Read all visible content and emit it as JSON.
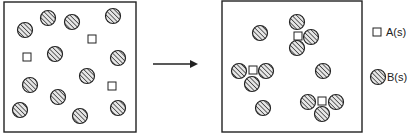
{
  "diagram": {
    "type": "particle-reaction",
    "colors": {
      "stroke": "#222222",
      "hatch": "#333333",
      "fill_bg": "#e8e8e8",
      "square_fill": "#ffffff",
      "background": "#ffffff"
    },
    "particle_radius": 7.5,
    "square_size": 8,
    "before_box": {
      "x": 4,
      "y": 2,
      "width": 132,
      "height": 130,
      "circles": [
        [
          25,
          30
        ],
        [
          48,
          18
        ],
        [
          72,
          22
        ],
        [
          113,
          16
        ],
        [
          55,
          54
        ],
        [
          118,
          58
        ],
        [
          87,
          76
        ],
        [
          30,
          85
        ],
        [
          58,
          97
        ],
        [
          20,
          110
        ],
        [
          80,
          116
        ],
        [
          118,
          108
        ]
      ],
      "squares": [
        [
          27,
          57
        ],
        [
          92,
          39
        ],
        [
          112,
          86
        ]
      ]
    },
    "arrow": {
      "x1": 153,
      "y1": 64,
      "x2": 200,
      "y2": 64
    },
    "after_box": {
      "x": 222,
      "y": 1,
      "width": 140,
      "height": 131,
      "single_circles": [
        [
          260,
          33
        ],
        [
          323,
          71
        ],
        [
          263,
          108
        ]
      ],
      "clusters": [
        {
          "square": [
            298,
            36
          ],
          "circles": [
            [
              297,
              22
            ],
            [
              311,
              37
            ],
            [
              297,
              48
            ]
          ]
        },
        {
          "square": [
            253,
            70
          ],
          "circles": [
            [
              239,
              71
            ],
            [
              266,
              71
            ],
            [
              252,
              84
            ]
          ]
        },
        {
          "square": [
            322,
            101
          ],
          "circles": [
            [
              308,
              102
            ],
            [
              336,
              102
            ],
            [
              322,
              114
            ]
          ]
        }
      ]
    },
    "legend": {
      "items": [
        {
          "symbol": "square",
          "label": "A(s)",
          "icon_x": 377,
          "icon_y": 32,
          "text_x": 386,
          "text_y": 26
        },
        {
          "symbol": "circle",
          "label": "B(s)",
          "icon_x": 378,
          "icon_y": 77,
          "text_x": 387,
          "text_y": 71
        }
      ]
    }
  }
}
